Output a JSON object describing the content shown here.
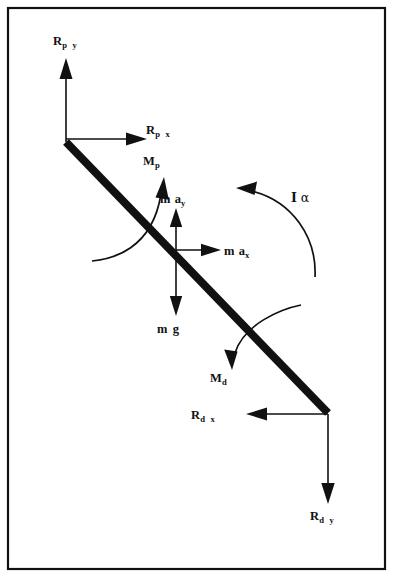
{
  "figure": {
    "type": "free-body-diagram",
    "background_color": "#ffffff",
    "ink_color": "#111111",
    "canvas": {
      "width": 393,
      "height": 577
    }
  },
  "frame": {
    "name": "outer-border",
    "x": 8,
    "y": 8,
    "width": 377,
    "height": 561,
    "stroke_width": 2.2
  },
  "body": {
    "name": "rigid-bar",
    "proximal_point": {
      "x": 66,
      "y": 142
    },
    "distal_point": {
      "x": 328,
      "y": 413
    },
    "center_of_mass": {
      "x": 176,
      "y": 252
    },
    "stroke_width": 8
  },
  "labels": {
    "rpy": {
      "base": "R",
      "sub": "p",
      "comp": "y",
      "text": "Rp y"
    },
    "rpx": {
      "base": "R",
      "sub": "p",
      "comp": "x",
      "text": "Rp x"
    },
    "mp": {
      "base": "M",
      "sub": "p",
      "comp": "",
      "text": "Mp"
    },
    "may": {
      "base": "m",
      "sub": "",
      "comp": "a",
      "compsub": "y",
      "text": "m ay"
    },
    "max": {
      "base": "m",
      "sub": "",
      "comp": "a",
      "compsub": "x",
      "text": "m ax"
    },
    "mg": {
      "base": "m",
      "sub": "",
      "comp": "g",
      "text": "m g"
    },
    "ialpha": {
      "base": "I",
      "greek": "α",
      "text": "I α"
    },
    "md": {
      "base": "M",
      "sub": "d",
      "comp": "",
      "text": "Md"
    },
    "rdx": {
      "base": "R",
      "sub": "d",
      "comp": "x",
      "text": "Rd x"
    },
    "rdy": {
      "base": "R",
      "sub": "d",
      "comp": "y",
      "text": "Rd y"
    }
  },
  "vectors": [
    {
      "name": "proximal-reaction-y",
      "label_key": "rpy",
      "kind": "straight",
      "direction": "up",
      "from": {
        "x": 66,
        "y": 142
      },
      "to": {
        "x": 66,
        "y": 62
      },
      "label_pos": {
        "x": 53,
        "y": 45
      }
    },
    {
      "name": "proximal-reaction-x",
      "label_key": "rpx",
      "kind": "straight",
      "direction": "right",
      "from": {
        "x": 66,
        "y": 139
      },
      "to": {
        "x": 142,
        "y": 139
      },
      "label_pos": {
        "x": 146,
        "y": 134
      }
    },
    {
      "name": "proximal-moment",
      "label_key": "mp",
      "kind": "curved",
      "direction": "counter-clockwise",
      "path": "M 93 260 C 108 258 150 250 160 190",
      "label_pos": {
        "x": 143,
        "y": 165
      }
    },
    {
      "name": "inertial-force-y",
      "label_key": "may",
      "kind": "straight",
      "direction": "up",
      "from": {
        "x": 176,
        "y": 252
      },
      "to": {
        "x": 176,
        "y": 212
      },
      "label_pos": {
        "x": 160,
        "y": 203
      }
    },
    {
      "name": "inertial-force-x",
      "label_key": "max",
      "kind": "straight",
      "direction": "right",
      "from": {
        "x": 176,
        "y": 250
      },
      "to": {
        "x": 216,
        "y": 250
      },
      "label_pos": {
        "x": 224,
        "y": 255
      }
    },
    {
      "name": "weight-force",
      "label_key": "mg",
      "kind": "straight",
      "direction": "down",
      "from": {
        "x": 176,
        "y": 252
      },
      "to": {
        "x": 176,
        "y": 312
      },
      "label_pos": {
        "x": 157,
        "y": 333
      }
    },
    {
      "name": "inertial-moment",
      "label_key": "ialpha",
      "kind": "curved",
      "direction": "counter-clockwise",
      "path": "M 313 275 C 315 235 290 200 248 190",
      "label_pos": {
        "x": 291,
        "y": 202
      }
    },
    {
      "name": "distal-moment",
      "label_key": "md",
      "kind": "curved",
      "direction": "clockwise",
      "path": "M 300 306 C 280 310 243 325 234 358",
      "label_pos": {
        "x": 210,
        "y": 382
      }
    },
    {
      "name": "distal-reaction-x",
      "label_key": "rdx",
      "kind": "straight",
      "direction": "left",
      "from": {
        "x": 328,
        "y": 414
      },
      "to": {
        "x": 254,
        "y": 414
      },
      "label_pos": {
        "x": 191,
        "y": 419
      }
    },
    {
      "name": "distal-reaction-y",
      "label_key": "rdy",
      "kind": "straight",
      "direction": "down",
      "from": {
        "x": 328,
        "y": 414
      },
      "to": {
        "x": 328,
        "y": 498
      },
      "label_pos": {
        "x": 310,
        "y": 520
      }
    }
  ]
}
